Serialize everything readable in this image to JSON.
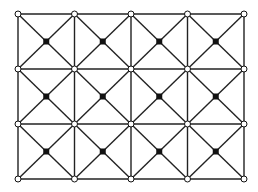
{
  "diagram": {
    "type": "grid-with-diagonals",
    "columns": 4,
    "rows": 3,
    "x_positions": [
      18,
      74.5,
      131,
      187.5,
      244
    ],
    "y_positions": [
      14,
      69,
      124,
      179
    ],
    "corner_node": {
      "shape": "open-circle",
      "radius": 3,
      "fill": "#ffffff",
      "stroke": "#111111"
    },
    "center_node": {
      "shape": "filled-dot",
      "size": 6,
      "fill": "#111111"
    },
    "line_color": "#222222",
    "line_width": 1.4
  }
}
